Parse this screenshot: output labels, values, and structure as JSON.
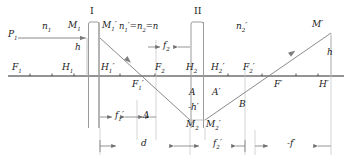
{
  "diagram": {
    "type": "optical-ray-diagram",
    "colors": {
      "axis": "#2b2b2b",
      "ray": "#8a8a8a",
      "lens_outline": "#9a9a9a",
      "construction": "#b8b8b8",
      "dimension": "#7a7a7a",
      "text": "#1a1a1a"
    },
    "lenses": [
      {
        "name": "I",
        "label": "I",
        "x_left": 87,
        "x_right": 100,
        "y_top": 22,
        "y_bottom": 128
      },
      {
        "name": "II",
        "label": "II",
        "x_left": 190,
        "x_right": 205,
        "y_top": 22,
        "y_bottom": 128
      }
    ],
    "axis": {
      "y": 76,
      "x_start": 8,
      "x_end": 344
    },
    "media_labels": [
      {
        "key": "n1",
        "text_main": "n",
        "sub": "1",
        "prime": "",
        "x": 44,
        "y": 24
      },
      {
        "key": "n1p_n2",
        "text_main": "n₁′=n₂=n",
        "x": 123,
        "y": 24
      },
      {
        "key": "n2p",
        "text_main": "n",
        "sub": "2",
        "prime": "′",
        "x": 238,
        "y": 24
      }
    ],
    "point_labels": [
      {
        "name": "P1",
        "text": "P₁",
        "x": 10,
        "y": 32
      },
      {
        "name": "M1",
        "text": "M₁",
        "x": 69,
        "y": 22
      },
      {
        "name": "M1p",
        "text": "M₁′",
        "x": 103,
        "y": 22
      },
      {
        "name": "Mp",
        "text": "M′",
        "x": 312,
        "y": 22
      },
      {
        "name": "F1",
        "text": "F₁",
        "x": 14,
        "y": 64
      },
      {
        "name": "H1",
        "text": "H₁",
        "x": 64,
        "y": 64
      },
      {
        "name": "H1p",
        "text": "H₁′",
        "x": 102,
        "y": 64
      },
      {
        "name": "F2",
        "text": "F₂",
        "x": 157,
        "y": 64
      },
      {
        "name": "H2",
        "text": "H₂",
        "x": 188,
        "y": 64
      },
      {
        "name": "H2p",
        "text": "H₂′",
        "x": 213,
        "y": 64
      },
      {
        "name": "F2p",
        "text": "F₂′",
        "x": 245,
        "y": 64
      },
      {
        "name": "Fp",
        "text": "F′",
        "x": 276,
        "y": 82
      },
      {
        "name": "Hp",
        "text": "H′",
        "x": 320,
        "y": 82
      },
      {
        "name": "F1p",
        "text": "F₁′",
        "x": 134,
        "y": 82
      },
      {
        "name": "A",
        "text": "A",
        "x": 190,
        "y": 92
      },
      {
        "name": "Ap",
        "text": "A′",
        "x": 213,
        "y": 92
      },
      {
        "name": "B",
        "text": "B",
        "x": 240,
        "y": 102
      },
      {
        "name": "M2",
        "text": "M₂",
        "x": 188,
        "y": 123
      },
      {
        "name": "M2p",
        "text": "M₂′",
        "x": 207,
        "y": 123
      },
      {
        "name": "h_left",
        "text": "h",
        "x": 76,
        "y": 44
      },
      {
        "name": "h_right",
        "text": "h",
        "x": 328,
        "y": 48
      },
      {
        "name": "hp",
        "text": "-h′",
        "x": 191,
        "y": 107
      }
    ],
    "dimensions": [
      {
        "name": "f2",
        "label": "f₂",
        "x_start": 156,
        "x_end": 190,
        "y": 47,
        "arrow_dir": "inward"
      },
      {
        "name": "f1p",
        "label": "f₁′",
        "x_start": 100,
        "x_end": 137,
        "y": 117,
        "arrow_dir": "inward"
      },
      {
        "name": "delta",
        "label": "Δ",
        "x_start": 137,
        "x_end": 156,
        "y": 117,
        "arrow_dir": "inward"
      },
      {
        "name": "d",
        "label": "d",
        "x_start": 100,
        "x_end": 190,
        "y": 146,
        "arrow_dir": "inward"
      },
      {
        "name": "f2p",
        "label": "f₂′",
        "x_start": 190,
        "x_end": 245,
        "y": 146,
        "arrow_dir": "inward"
      },
      {
        "name": "fp",
        "label": "-f′",
        "x_start": 255,
        "x_end": 331,
        "y": 146,
        "arrow_dir": "inward"
      }
    ],
    "rays": [
      {
        "name": "incoming-ray",
        "desc": "horizontal from P1 to M1 at height h",
        "points": "18,38 87,38"
      },
      {
        "name": "ray-lens1-to-M2",
        "desc": "descending ray from M1' through F1' to M2",
        "points": "100,38 190,120"
      },
      {
        "name": "ray-out",
        "desc": "ascending ray from M2' through F' to M'",
        "points": "205,120 331,33"
      }
    ]
  }
}
